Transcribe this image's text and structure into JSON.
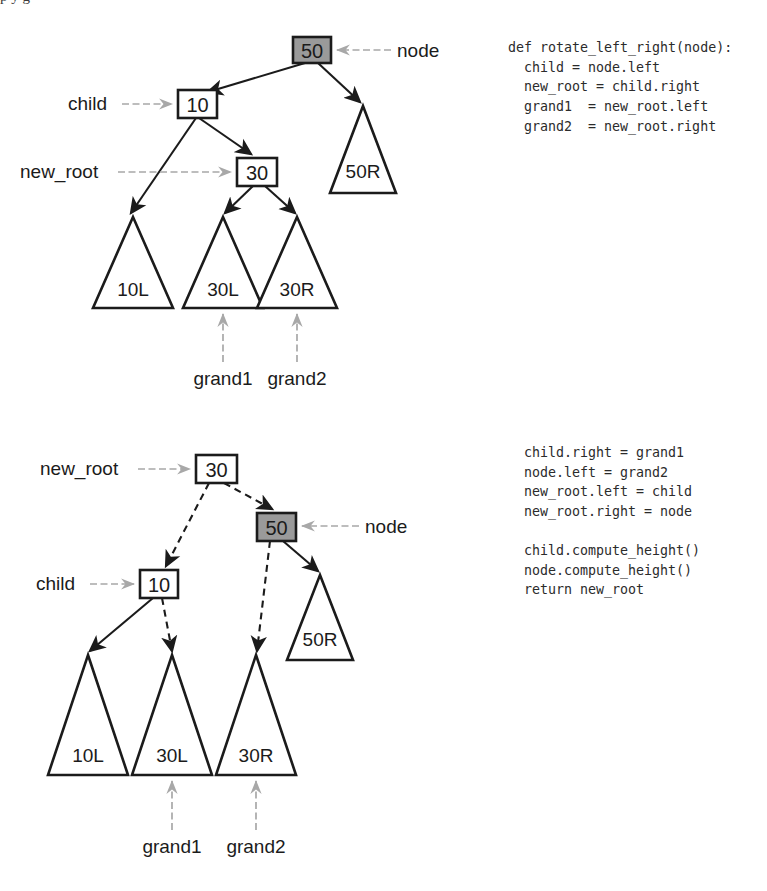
{
  "page": {
    "title_partial": "p y g",
    "background": "#ffffff"
  },
  "colors": {
    "ink": "#1b1b1b",
    "node_highlight_fill": "#9a9a9a",
    "node_highlight_text": "#ffffff",
    "node_fill": "#ffffff",
    "pointer_arrow": "#a8a8a8",
    "code_text": "#2b2b2b"
  },
  "code_blocks": [
    {
      "id": "rotate-left-right-part1",
      "lines": [
        "def rotate_left_right(node):",
        "  child = node.left",
        "  new_root = child.right",
        "  grand1  = new_root.left",
        "  grand2  = new_root.right"
      ]
    },
    {
      "id": "rotate-left-right-part2",
      "lines": [
        "  child.right = grand1",
        "  node.left = grand2",
        "  new_root.left = child",
        "  new_root.right = node",
        "",
        "  child.compute_height()",
        "  node.compute_height()",
        "  return new_root"
      ]
    }
  ],
  "diagrams": [
    {
      "id": "before-rotation",
      "caption": "tree before rotate_left_right",
      "nodes": [
        {
          "id": "n50",
          "label": "50",
          "shape": "box",
          "highlight": true,
          "x": 293,
          "y": 37,
          "w": 38,
          "h": 26
        },
        {
          "id": "n10",
          "label": "10",
          "shape": "box",
          "highlight": false,
          "x": 178,
          "y": 90,
          "w": 39,
          "h": 28
        },
        {
          "id": "n30",
          "label": "30",
          "shape": "box",
          "highlight": false,
          "x": 237,
          "y": 158,
          "w": 40,
          "h": 28
        }
      ],
      "subtrees": [
        {
          "id": "t50R",
          "label": "50R",
          "apex_x": 363,
          "apex_y": 106,
          "half_w": 33,
          "base_y": 193
        },
        {
          "id": "t10L",
          "label": "10L",
          "apex_x": 133,
          "apex_y": 217,
          "half_w": 40,
          "base_y": 308
        },
        {
          "id": "t30L",
          "label": "30L",
          "apex_x": 223,
          "apex_y": 217,
          "half_w": 40,
          "base_y": 308
        },
        {
          "id": "t30R",
          "label": "30R",
          "apex_x": 297,
          "apex_y": 217,
          "half_w": 40,
          "base_y": 308
        }
      ],
      "edges": [
        {
          "from": "n50",
          "to": "n10",
          "style": "solid"
        },
        {
          "from": "n50",
          "to": "t50R",
          "style": "solid"
        },
        {
          "from": "n10",
          "to": "t10L",
          "style": "solid"
        },
        {
          "from": "n10",
          "to": "n30",
          "style": "solid"
        },
        {
          "from": "n30",
          "to": "t30L",
          "style": "solid"
        },
        {
          "from": "n30",
          "to": "t30R",
          "style": "solid"
        }
      ],
      "pointers": [
        {
          "id": "p-node",
          "text": "node",
          "target": "n50",
          "side": "right",
          "text_x": 397,
          "text_y": 56
        },
        {
          "id": "p-child",
          "text": "child",
          "target": "n10",
          "side": "left",
          "text_x": 68,
          "text_y": 110
        },
        {
          "id": "p-new_root",
          "text": "new_root",
          "target": "n30",
          "side": "left",
          "text_x": 20,
          "text_y": 178
        },
        {
          "id": "p-grand1",
          "text": "grand1",
          "target": "t30L",
          "side": "below",
          "text_x": 193,
          "text_y": 383
        },
        {
          "id": "p-grand2",
          "text": "grand2",
          "target": "t30R",
          "side": "below",
          "text_x": 268,
          "text_y": 383
        }
      ]
    },
    {
      "id": "after-rotation",
      "caption": "tree after rotate_left_right",
      "nodes": [
        {
          "id": "b30",
          "label": "30",
          "shape": "box",
          "highlight": false,
          "x": 196,
          "y": 455,
          "w": 41,
          "h": 28
        },
        {
          "id": "b50",
          "label": "50",
          "shape": "box",
          "highlight": true,
          "x": 257,
          "y": 513,
          "w": 39,
          "h": 28
        },
        {
          "id": "b10",
          "label": "10",
          "shape": "box",
          "highlight": false,
          "x": 140,
          "y": 570,
          "w": 38,
          "h": 28
        }
      ],
      "subtrees": [
        {
          "id": "b50R",
          "label": "50R",
          "apex_x": 320,
          "apex_y": 575,
          "half_w": 33,
          "base_y": 660
        },
        {
          "id": "b10L",
          "label": "10L",
          "apex_x": 88,
          "apex_y": 655,
          "half_w": 40,
          "base_y": 775
        },
        {
          "id": "b30L",
          "label": "30L",
          "apex_x": 172,
          "apex_y": 655,
          "half_w": 40,
          "base_y": 775
        },
        {
          "id": "b30R",
          "label": "30R",
          "apex_x": 256,
          "apex_y": 655,
          "half_w": 40,
          "base_y": 775
        }
      ],
      "edges": [
        {
          "from": "b30",
          "to": "b10",
          "style": "dashed"
        },
        {
          "from": "b30",
          "to": "b50",
          "style": "dashed"
        },
        {
          "from": "b50",
          "to": "b30R",
          "style": "dashed"
        },
        {
          "from": "b50",
          "to": "b50R",
          "style": "solid"
        },
        {
          "from": "b10",
          "to": "b10L",
          "style": "solid"
        },
        {
          "from": "b10",
          "to": "b30L",
          "style": "dashed"
        }
      ],
      "pointers": [
        {
          "id": "q-new_root",
          "text": "new_root",
          "target": "b30",
          "side": "left",
          "text_x": 40,
          "text_y": 475
        },
        {
          "id": "q-node",
          "text": "node",
          "target": "b50",
          "side": "right",
          "text_x": 365,
          "text_y": 532
        },
        {
          "id": "q-child",
          "text": "child",
          "target": "b10",
          "side": "left",
          "text_x": 36,
          "text_y": 590
        },
        {
          "id": "q-grand1",
          "text": "grand1",
          "target": "b30L",
          "side": "below",
          "text_x": 142,
          "text_y": 850
        },
        {
          "id": "q-grand2",
          "text": "grand2",
          "target": "b30R",
          "side": "below",
          "text_x": 226,
          "text_y": 850
        }
      ]
    }
  ]
}
